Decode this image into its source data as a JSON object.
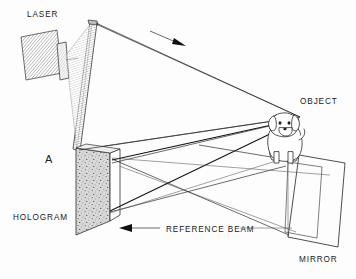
{
  "figure": {
    "panel_label": "A",
    "background_color": "#fdfdfd",
    "ink_color": "#1e1e1e"
  },
  "labels": [
    {
      "id": "laser",
      "text": "LASER",
      "x": 27,
      "y": 17
    },
    {
      "id": "object",
      "text": "OBJECT",
      "x": 300,
      "y": 104
    },
    {
      "id": "hologram",
      "text": "HOLOGRAM",
      "x": 13,
      "y": 220
    },
    {
      "id": "mirror",
      "text": "MIRROR",
      "x": 299,
      "y": 262
    },
    {
      "id": "reference_beam",
      "text": "REFERENCE BEAM",
      "x": 166,
      "y": 234
    }
  ],
  "components": {
    "laser": {
      "name": "laser",
      "label": "LASER",
      "fill_style": "hatched",
      "color": "#8e8e8e"
    },
    "beam_expander": {
      "name": "beam-expander-plate",
      "fill_style": "hatched",
      "color": "#9a9a9a"
    },
    "hologram_plate": {
      "name": "hologram-plate",
      "label": "HOLOGRAM",
      "fill_style": "speckled",
      "color": "#c9c9c9"
    },
    "mirror": {
      "name": "mirror-panel",
      "label": "MIRROR",
      "fill_style": "outline",
      "color": "#ffffff"
    },
    "object": {
      "name": "object-dog",
      "label": "OBJECT",
      "description": "puppy"
    }
  },
  "beams": {
    "top_beam_arrow_direction": "right",
    "reference_beam_arrow_direction": "left",
    "object_beam_arrow_direction": "down-right",
    "ray_color": "#2b2b2b"
  }
}
